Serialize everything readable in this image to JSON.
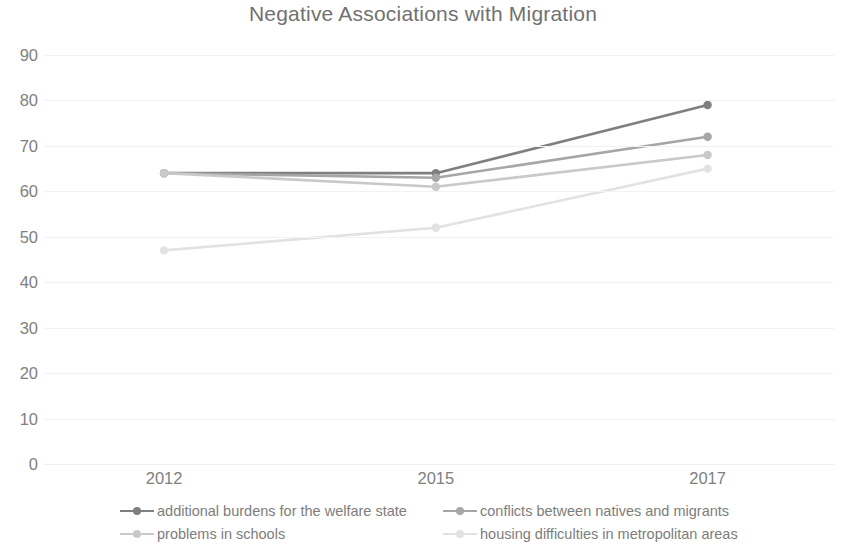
{
  "chart_data": {
    "type": "line",
    "title": "Negative Associations with Migration",
    "xlabel": "",
    "ylabel": "",
    "categories": [
      "2012",
      "2015",
      "2017"
    ],
    "ylim": [
      0,
      90
    ],
    "ytick_step": 10,
    "yticks": [
      "90",
      "80",
      "70",
      "60",
      "50",
      "40",
      "30",
      "20",
      "10",
      "0"
    ],
    "grid": true,
    "legend_position": "bottom",
    "series": [
      {
        "name": "additional burdens for the welfare state",
        "values": [
          64,
          64,
          79
        ],
        "color": "#7f7f7f"
      },
      {
        "name": "conflicts between natives and migrants",
        "values": [
          64,
          63,
          72
        ],
        "color": "#a6a6a6"
      },
      {
        "name": "problems in schools",
        "values": [
          64,
          61,
          68
        ],
        "color": "#c9c9c9"
      },
      {
        "name": "housing difficulties in metropolitan areas",
        "values": [
          47,
          52,
          65
        ],
        "color": "#e2e2e2"
      }
    ]
  }
}
